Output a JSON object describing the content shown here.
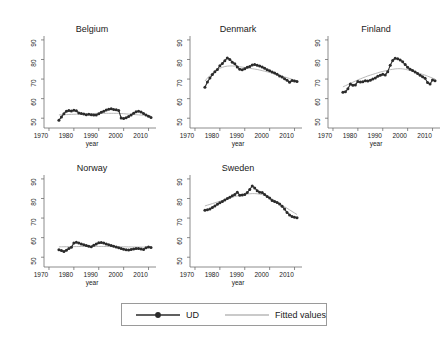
{
  "figure": {
    "background": "#ffffff",
    "series_color": "#2b2b2b",
    "fit_color": "#b9b9b9",
    "axis_color": "#6e6e6e"
  },
  "legend": {
    "entries": [
      {
        "label": "UD",
        "key": "line-marker",
        "color": "#2b2b2b"
      },
      {
        "label": "Fitted values",
        "key": "line",
        "color": "#b9b9b9"
      }
    ]
  },
  "axes": {
    "ylabel": "",
    "xlabel": "year",
    "yticks": [
      "50",
      "60",
      "70",
      "80",
      "90"
    ],
    "xticks": [
      "1970",
      "1980",
      "1990",
      "2000",
      "2010"
    ],
    "ylim": [
      45,
      92
    ],
    "xlim": [
      1968,
      2013
    ]
  },
  "chart_data": {
    "type": "line",
    "title": "",
    "xlabel": "year",
    "ylabel": "UD",
    "xlim": [
      1968,
      2013
    ],
    "ylim": [
      45,
      92
    ],
    "grid": false,
    "legend_position": "bottom",
    "panels": [
      {
        "name": "Belgium",
        "x": [
          1974,
          1975,
          1976,
          1977,
          1978,
          1979,
          1980,
          1981,
          1982,
          1983,
          1984,
          1985,
          1986,
          1987,
          1988,
          1989,
          1990,
          1991,
          1992,
          1993,
          1994,
          1995,
          1996,
          1997,
          1998,
          1999,
          2000,
          2001,
          2002,
          2003,
          2004,
          2005,
          2006,
          2007,
          2008,
          2009,
          2010,
          2011
        ],
        "series": [
          {
            "name": "UD",
            "values": [
              49.0,
              50.6,
              52.3,
              53.6,
              54.0,
              53.7,
              54.1,
              53.8,
              52.7,
              52.4,
              52.1,
              51.8,
              52.0,
              51.8,
              51.6,
              51.7,
              52.3,
              53.0,
              53.6,
              54.2,
              54.6,
              54.8,
              54.5,
              54.3,
              54.0,
              50.1,
              49.9,
              50.3,
              50.9,
              51.7,
              52.5,
              53.3,
              53.6,
              53.2,
              52.4,
              51.6,
              51.0,
              50.4
            ]
          },
          {
            "name": "Fitted values",
            "values": [
              51.7,
              51.75,
              51.8,
              51.85,
              51.9,
              51.95,
              52.0,
              52.05,
              52.1,
              52.15,
              52.2,
              52.25,
              52.3,
              52.35,
              52.4,
              52.45,
              52.5,
              52.5,
              52.5,
              52.5,
              52.5,
              52.5,
              52.5,
              52.5,
              52.5,
              52.4,
              52.3,
              52.2,
              52.1,
              52.0,
              51.9,
              51.8,
              51.7,
              51.6,
              51.5,
              51.4,
              51.3,
              51.2
            ]
          }
        ]
      },
      {
        "name": "Denmark",
        "x": [
          1974,
          1975,
          1976,
          1977,
          1978,
          1979,
          1980,
          1981,
          1982,
          1983,
          1984,
          1985,
          1986,
          1987,
          1988,
          1989,
          1990,
          1991,
          1992,
          1993,
          1994,
          1995,
          1996,
          1997,
          1998,
          1999,
          2000,
          2001,
          2002,
          2003,
          2004,
          2005,
          2006,
          2007,
          2008,
          2009,
          2010,
          2011
        ],
        "series": [
          {
            "name": "UD",
            "values": [
              65.8,
              68.5,
              70.5,
              72.3,
              73.7,
              74.9,
              76.8,
              78.0,
              79.4,
              80.8,
              80.0,
              78.6,
              77.8,
              76.2,
              75.0,
              74.8,
              75.3,
              76.0,
              76.4,
              77.2,
              77.5,
              77.0,
              76.7,
              76.2,
              75.5,
              74.8,
              74.2,
              73.6,
              73.1,
              72.4,
              71.6,
              71.0,
              70.2,
              69.4,
              68.4,
              69.3,
              69.0,
              68.8
            ]
          },
          {
            "name": "Fitted values",
            "values": [
              69.0,
              70.5,
              71.8,
              73.0,
              74.0,
              74.8,
              75.5,
              76.0,
              76.4,
              76.6,
              76.7,
              76.7,
              76.6,
              76.5,
              76.3,
              76.1,
              75.9,
              75.7,
              75.5,
              75.3,
              75.1,
              74.9,
              74.6,
              74.3,
              74.0,
              73.7,
              73.4,
              73.1,
              72.7,
              72.3,
              71.9,
              71.5,
              71.1,
              70.7,
              70.3,
              69.9,
              69.5,
              69.1
            ]
          }
        ]
      },
      {
        "name": "Finland",
        "x": [
          1974,
          1975,
          1976,
          1977,
          1978,
          1979,
          1980,
          1981,
          1982,
          1983,
          1984,
          1985,
          1986,
          1987,
          1988,
          1989,
          1990,
          1991,
          1992,
          1993,
          1994,
          1995,
          1996,
          1997,
          1998,
          1999,
          2000,
          2001,
          2002,
          2003,
          2004,
          2005,
          2006,
          2007,
          2008,
          2009,
          2010,
          2011
        ],
        "series": [
          {
            "name": "UD",
            "values": [
              63.2,
              63.5,
              65.0,
              67.5,
              66.8,
              67.0,
              68.8,
              68.5,
              68.6,
              69.2,
              69.0,
              69.4,
              70.0,
              70.5,
              71.4,
              72.0,
              72.4,
              72.1,
              73.8,
              77.0,
              79.5,
              80.6,
              80.4,
              79.8,
              78.8,
              77.4,
              76.0,
              75.0,
              74.4,
              73.6,
              72.8,
              72.0,
              71.2,
              70.4,
              68.2,
              67.5,
              69.5,
              69.2
            ]
          },
          {
            "name": "Fitted values",
            "values": [
              66.0,
              66.6,
              67.2,
              67.8,
              68.4,
              69.0,
              69.6,
              70.1,
              70.6,
              71.1,
              71.6,
              72.0,
              72.4,
              72.8,
              73.2,
              73.6,
              73.9,
              74.2,
              74.5,
              74.8,
              75.0,
              75.2,
              75.3,
              75.3,
              75.2,
              75.0,
              74.7,
              74.4,
              74.0,
              73.6,
              73.2,
              72.8,
              72.4,
              72.0,
              71.5,
              71.0,
              70.5,
              70.0
            ]
          }
        ]
      },
      {
        "name": "Norway",
        "x": [
          1974,
          1975,
          1976,
          1977,
          1978,
          1979,
          1980,
          1981,
          1982,
          1983,
          1984,
          1985,
          1986,
          1987,
          1988,
          1989,
          1990,
          1991,
          1992,
          1993,
          1994,
          1995,
          1996,
          1997,
          1998,
          1999,
          2000,
          2001,
          2002,
          2003,
          2004,
          2005,
          2006,
          2007,
          2008,
          2009,
          2010,
          2011
        ],
        "series": [
          {
            "name": "UD",
            "values": [
              53.8,
              53.4,
              52.9,
              53.6,
              54.4,
              55.1,
              57.3,
              57.6,
              57.2,
              56.8,
              56.4,
              56.0,
              55.6,
              55.4,
              56.1,
              56.8,
              57.4,
              57.5,
              57.2,
              56.8,
              56.4,
              56.0,
              55.6,
              55.2,
              54.8,
              54.4,
              54.1,
              53.8,
              53.7,
              54.0,
              54.2,
              54.4,
              54.5,
              54.2,
              54.0,
              54.8,
              55.2,
              55.0
            ]
          },
          {
            "name": "Fitted values",
            "values": [
              55.3,
              55.32,
              55.34,
              55.36,
              55.38,
              55.4,
              55.42,
              55.44,
              55.46,
              55.48,
              55.5,
              55.5,
              55.5,
              55.5,
              55.5,
              55.5,
              55.5,
              55.5,
              55.48,
              55.46,
              55.44,
              55.42,
              55.4,
              55.38,
              55.36,
              55.34,
              55.32,
              55.3,
              55.28,
              55.26,
              55.24,
              55.22,
              55.2,
              55.18,
              55.16,
              55.14,
              55.12,
              55.1
            ]
          }
        ]
      },
      {
        "name": "Sweden",
        "x": [
          1974,
          1975,
          1976,
          1977,
          1978,
          1979,
          1980,
          1981,
          1982,
          1983,
          1984,
          1985,
          1986,
          1987,
          1988,
          1989,
          1990,
          1991,
          1992,
          1993,
          1994,
          1995,
          1996,
          1997,
          1998,
          1999,
          2000,
          2001,
          2002,
          2003,
          2004,
          2005,
          2006,
          2007,
          2008,
          2009,
          2010,
          2011
        ],
        "series": [
          {
            "name": "UD",
            "values": [
              74.0,
              74.2,
              74.6,
              75.4,
              76.2,
              77.0,
              77.8,
              78.4,
              79.2,
              80.0,
              80.6,
              81.4,
              82.0,
              83.2,
              81.6,
              81.8,
              82.0,
              83.0,
              84.6,
              86.4,
              85.4,
              84.0,
              83.2,
              83.0,
              82.0,
              81.0,
              80.2,
              79.0,
              78.4,
              78.0,
              77.2,
              76.0,
              74.6,
              72.8,
              71.6,
              70.8,
              70.4,
              70.2
            ]
          },
          {
            "name": "Fitted values",
            "values": [
              76.2,
              76.6,
              77.0,
              77.4,
              77.8,
              78.2,
              78.6,
              79.0,
              79.4,
              79.8,
              80.2,
              80.6,
              81.0,
              81.3,
              81.6,
              81.9,
              82.1,
              82.3,
              82.4,
              82.5,
              82.5,
              82.4,
              82.2,
              82.0,
              81.6,
              81.1,
              80.5,
              79.8,
              79.0,
              78.2,
              77.4,
              76.6,
              75.8,
              75.0,
              74.2,
              73.4,
              72.6,
              71.8
            ]
          }
        ]
      }
    ]
  }
}
